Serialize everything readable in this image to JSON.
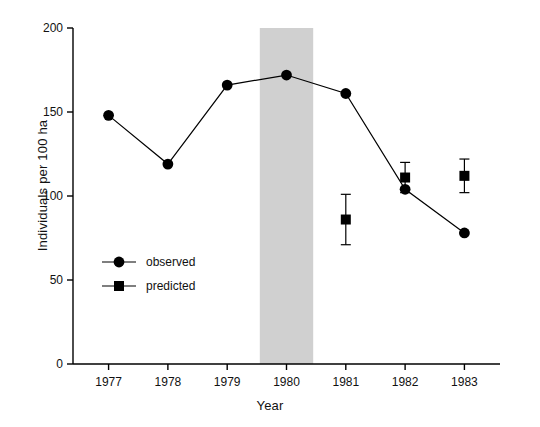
{
  "chart_data": {
    "type": "line",
    "title": "",
    "xlabel": "Year",
    "ylabel": "Individuals per 100 ha",
    "categories": [
      "1977",
      "1978",
      "1979",
      "1980",
      "1981",
      "1982",
      "1983"
    ],
    "xlim": [
      1976.4,
      1983.6
    ],
    "ylim": [
      0,
      200
    ],
    "yticks": [
      "0",
      "50",
      "100",
      "150",
      "200"
    ],
    "ytick_values": [
      0,
      50,
      100,
      150,
      200
    ],
    "grid": false,
    "legend_position": "inside-left-lower",
    "series": [
      {
        "name": "observed",
        "marker": "circle",
        "x": [
          "1977",
          "1978",
          "1979",
          "1980",
          "1981",
          "1982",
          "1983"
        ],
        "values": [
          148,
          119,
          166,
          172,
          161,
          104,
          78
        ],
        "errors": [
          null,
          null,
          null,
          null,
          null,
          null,
          null
        ]
      },
      {
        "name": "predicted",
        "marker": "square",
        "x": [
          "1981",
          "1982",
          "1983"
        ],
        "values": [
          86,
          111,
          112
        ],
        "errors": [
          15,
          9,
          10
        ]
      }
    ],
    "annotations": [
      {
        "name": "shaded-band",
        "type": "vertical-band",
        "x_start": "1979.55",
        "x_end": "1980.45",
        "color": "#d0d0d0"
      }
    ]
  },
  "legend": {
    "items": [
      {
        "label": "observed",
        "marker": "circle"
      },
      {
        "label": "predicted",
        "marker": "square"
      }
    ]
  },
  "axes": {
    "x_title": "Year",
    "y_title": "Individuals per 100 ha"
  }
}
